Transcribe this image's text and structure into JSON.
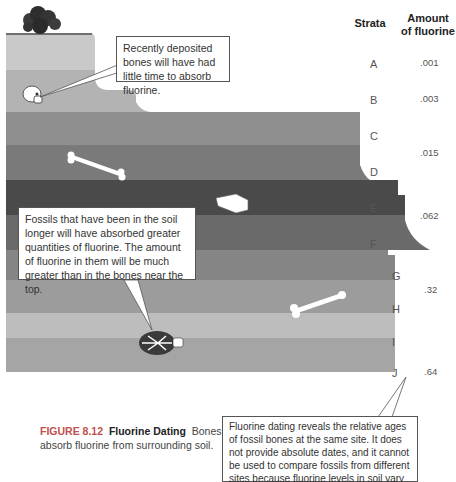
{
  "table": {
    "col_strata": "Strata",
    "col_amount_1": "Amount",
    "col_amount_2": "of fluorine",
    "strata": [
      {
        "label": "A",
        "y": 58
      },
      {
        "label": "B",
        "y": 94
      },
      {
        "label": "C",
        "y": 130
      },
      {
        "label": "D",
        "y": 166
      },
      {
        "label": "E",
        "y": 202
      },
      {
        "label": "F",
        "y": 238
      },
      {
        "label": "G",
        "y": 270
      },
      {
        "label": "H",
        "y": 303
      },
      {
        "label": "I",
        "y": 336
      },
      {
        "label": "J",
        "y": 367
      }
    ],
    "values": [
      {
        "text": ".001",
        "y": 57
      },
      {
        "text": ".003",
        "y": 93
      },
      {
        "text": ".015",
        "y": 147
      },
      {
        "text": ".062",
        "y": 210
      },
      {
        "text": ".32",
        "y": 284
      },
      {
        "text": ".64",
        "y": 366
      }
    ]
  },
  "callouts": {
    "top": "Recently deposited bones will have had little time to absorb fluorine.",
    "middle": "Fossils that have been in the soil longer will have absorbed greater quantities of fluorine. The amount of fluorine in them will be much greater than in the bones near the top.",
    "bottom": "Fluorine dating reveals the relative ages of fossil bones at the same site. It does not provide absolute dates, and it cannot be used to compare fossils from different sites because fluorine levels in soil vary from place to place."
  },
  "caption": {
    "figure": "FIGURE 8.12",
    "title": "Fluorine Dating",
    "text": "Bones absorb fluorine from surrounding soil."
  },
  "colors": {
    "stratum_a": "#c9c9c9",
    "stratum_b": "#b3b3b3",
    "stratum_c": "#8f8f8f",
    "stratum_d": "#7a7a7a",
    "stratum_e": "#4a4a4a",
    "stratum_f": "#6a6a6a",
    "stratum_g": "#858585",
    "stratum_h": "#9c9c9c",
    "stratum_i": "#bdbdbd",
    "stratum_j": "#a5a5a5",
    "caption_accent": "#c0504d"
  }
}
